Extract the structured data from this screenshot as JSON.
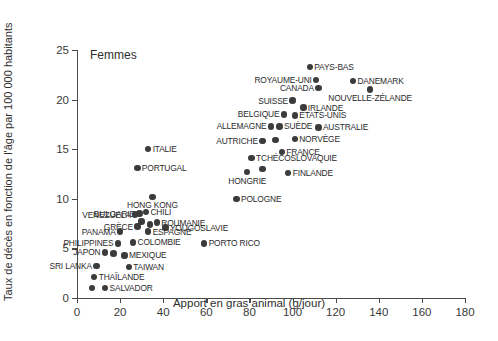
{
  "chart_data": {
    "type": "scatter",
    "title": "",
    "annotation": "Femmes",
    "xlabel": "Apport en gras animal (g/jour)",
    "ylabel": "Taux de décès en fonction de l'âge par 100 000 habitants",
    "xlim": [
      0,
      180
    ],
    "ylim": [
      0,
      25
    ],
    "xticks": [
      0,
      20,
      40,
      60,
      80,
      100,
      120,
      140,
      160,
      180
    ],
    "yticks": [
      0,
      5,
      10,
      15,
      20,
      25
    ],
    "grid": false,
    "legend": "none",
    "marker_color": "#3b3b3b",
    "axis_color": "#4a4a4a",
    "points": [
      {
        "label": "PAYS-BAS",
        "x": 108,
        "y": 23.3,
        "pos": "r"
      },
      {
        "label": "ROYAUME-UNI",
        "x": 111,
        "y": 22.0,
        "pos": "l"
      },
      {
        "label": "DANEMARK",
        "x": 128,
        "y": 21.9,
        "pos": "r"
      },
      {
        "label": "CANADA",
        "x": 112,
        "y": 21.2,
        "pos": "l"
      },
      {
        "label": "NOUVELLE-ZÉLANDE",
        "x": 136,
        "y": 21.0,
        "pos": "c"
      },
      {
        "label": "SUISSE",
        "x": 100,
        "y": 19.9,
        "pos": "l"
      },
      {
        "label": "IRLANDE",
        "x": 105,
        "y": 19.2,
        "pos": "r"
      },
      {
        "label": "BELGIQUE",
        "x": 96,
        "y": 18.5,
        "pos": "l"
      },
      {
        "label": "ÉTATS-UNIS",
        "x": 101,
        "y": 18.4,
        "pos": "r"
      },
      {
        "label": "ALLEMAGNE",
        "x": 90,
        "y": 17.3,
        "pos": "l"
      },
      {
        "label": "SUÈDE",
        "x": 94,
        "y": 17.3,
        "pos": "r"
      },
      {
        "label": "AUSTRALIE",
        "x": 112,
        "y": 17.2,
        "pos": "r"
      },
      {
        "label": "NORVÈGE",
        "x": 101,
        "y": 16.0,
        "pos": "r"
      },
      {
        "label": "AUTRICHE",
        "x": 86,
        "y": 15.8,
        "pos": "l"
      },
      {
        "label": "FRANCE",
        "x": 95,
        "y": 14.7,
        "pos": "r"
      },
      {
        "label": "TCHÉCOSLOVAQUIE",
        "x": 81,
        "y": 14.1,
        "pos": "r"
      },
      {
        "label": "FINLANDE",
        "x": 98,
        "y": 12.6,
        "pos": "r"
      },
      {
        "label": "HONGRIE",
        "x": 79,
        "y": 12.7,
        "pos": "c"
      },
      {
        "label": "ITALIE",
        "x": 33,
        "y": 15.0,
        "pos": "r"
      },
      {
        "label": "PORTUGAL",
        "x": 28,
        "y": 13.1,
        "pos": "r"
      },
      {
        "label": "POLOGNE",
        "x": 74,
        "y": 10.0,
        "pos": "r"
      },
      {
        "label": "HONG KONG",
        "x": 35,
        "y": 10.2,
        "pos": "c"
      },
      {
        "label": "CHILI",
        "x": 32,
        "y": 8.7,
        "pos": "r"
      },
      {
        "label": "BULGARIE",
        "x": 29,
        "y": 8.5,
        "pos": "l"
      },
      {
        "label": "VENEZUELA",
        "x": 27,
        "y": 8.4,
        "pos": "l"
      },
      {
        "label": "ROUMANIE",
        "x": 37,
        "y": 7.6,
        "pos": "r"
      },
      {
        "label": "YOUGOSLAVIE",
        "x": 41,
        "y": 7.1,
        "pos": "r"
      },
      {
        "label": "GRÈCE",
        "x": 28,
        "y": 7.2,
        "pos": "l"
      },
      {
        "label": "PANAMA",
        "x": 20,
        "y": 6.7,
        "pos": "l"
      },
      {
        "label": "ESPAGNE",
        "x": 33,
        "y": 6.7,
        "pos": "r"
      },
      {
        "label": "PHILIPPINES",
        "x": 19,
        "y": 5.5,
        "pos": "l"
      },
      {
        "label": "COLOMBIE",
        "x": 26,
        "y": 5.6,
        "pos": "r"
      },
      {
        "label": "PORTO RICO",
        "x": 59,
        "y": 5.5,
        "pos": "r"
      },
      {
        "label": "MEXIQUE",
        "x": 22,
        "y": 4.3,
        "pos": "r"
      },
      {
        "label": "JAPON",
        "x": 13,
        "y": 4.6,
        "pos": "l"
      },
      {
        "label": "SRI LANKA",
        "x": 9,
        "y": 3.2,
        "pos": "l"
      },
      {
        "label": "TAIWAN",
        "x": 24,
        "y": 3.1,
        "pos": "r"
      },
      {
        "label": "THAÏLANDE",
        "x": 8,
        "y": 2.1,
        "pos": "r"
      },
      {
        "label": "SALVADOR",
        "x": 13,
        "y": 1.0,
        "pos": "r"
      },
      {
        "label": "",
        "x": 7,
        "y": 1.0,
        "pos": "r"
      },
      {
        "label": "",
        "x": 17,
        "y": 4.5,
        "pos": "r"
      },
      {
        "label": "",
        "x": 30,
        "y": 7.7,
        "pos": "r"
      },
      {
        "label": "",
        "x": 34,
        "y": 7.4,
        "pos": "r"
      },
      {
        "label": "",
        "x": 92,
        "y": 15.9,
        "pos": "r"
      },
      {
        "label": "",
        "x": 86,
        "y": 13.0,
        "pos": "r"
      }
    ]
  }
}
